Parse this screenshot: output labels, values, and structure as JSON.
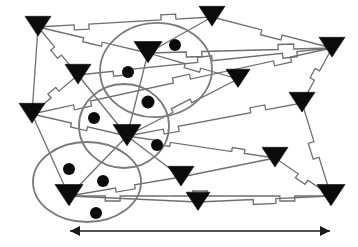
{
  "figure": {
    "title": "",
    "background_color": "#ffffff",
    "width": 358,
    "height": 247
  },
  "style": {
    "node_color": "#0b0b0b",
    "dot_color": "#0b0b0b",
    "edge_color": "#6f6f6f",
    "ellipse_color": "#7a7a7a",
    "arrow_color": "#1a1a1a",
    "edge_width": 1.3,
    "ellipse_width": 1.8,
    "arrow_width": 1.6
  },
  "legend": {
    "node_shape_name": "down-triangle",
    "dot_shape_name": "filled-circle",
    "cluster_shape_name": "ellipse",
    "edge_shape_name": "zigzag-polyline",
    "scale_bar_name": "double-headed-arrow"
  },
  "graph": {
    "node_count": 14,
    "dot_count": 9,
    "cluster_count": 3,
    "edge_count": 26,
    "nodes": [
      {
        "id": "n1",
        "x": 38,
        "y": 27,
        "size": 13
      },
      {
        "id": "n2",
        "x": 78,
        "y": 75,
        "size": 13
      },
      {
        "id": "n3",
        "x": 32,
        "y": 114,
        "size": 13
      },
      {
        "id": "n4",
        "x": 212,
        "y": 17,
        "size": 13
      },
      {
        "id": "n5",
        "x": 148,
        "y": 53,
        "size": 14
      },
      {
        "id": "n6",
        "x": 332,
        "y": 48,
        "size": 13
      },
      {
        "id": "n7",
        "x": 238,
        "y": 79,
        "size": 12
      },
      {
        "id": "n8",
        "x": 302,
        "y": 103,
        "size": 13
      },
      {
        "id": "n9",
        "x": 127,
        "y": 136,
        "size": 14
      },
      {
        "id": "n10",
        "x": 69,
        "y": 196,
        "size": 14
      },
      {
        "id": "n11",
        "x": 181,
        "y": 177,
        "size": 13
      },
      {
        "id": "n12",
        "x": 198,
        "y": 202,
        "size": 12
      },
      {
        "id": "n13",
        "x": 275,
        "y": 158,
        "size": 13
      },
      {
        "id": "n14",
        "x": 331,
        "y": 196,
        "size": 14
      }
    ],
    "dots": [
      {
        "id": "d1",
        "x": 175,
        "y": 45,
        "r": 6
      },
      {
        "id": "d2",
        "x": 128,
        "y": 72,
        "r": 6
      },
      {
        "id": "d3",
        "x": 148,
        "y": 102,
        "r": 6.5
      },
      {
        "id": "d4",
        "x": 94,
        "y": 118,
        "r": 6
      },
      {
        "id": "d5",
        "x": 157,
        "y": 145,
        "r": 6
      },
      {
        "id": "d6",
        "x": 69,
        "y": 169,
        "r": 6
      },
      {
        "id": "d7",
        "x": 103,
        "y": 181,
        "r": 6
      },
      {
        "id": "d8",
        "x": 96,
        "y": 213,
        "r": 6
      },
      {
        "id": "d9",
        "x": 320,
        "y": 140,
        "r": 0
      }
    ],
    "clusters": [
      {
        "id": "c1",
        "label": "top-cluster",
        "cx": 156,
        "cy": 70,
        "rx": 56,
        "ry": 47,
        "rotation": -4
      },
      {
        "id": "c2",
        "label": "middle-cluster",
        "cx": 124,
        "cy": 126,
        "rx": 45,
        "ry": 42,
        "rotation": 0
      },
      {
        "id": "c3",
        "label": "bottom-cluster",
        "cx": 87,
        "cy": 182,
        "rx": 54,
        "ry": 40,
        "rotation": 0
      }
    ],
    "edges": [
      {
        "from": "n1",
        "to": "n4",
        "style": "zigzag",
        "amp": 5
      },
      {
        "from": "n1",
        "to": "n2",
        "style": "zigzag",
        "amp": 5
      },
      {
        "from": "n1",
        "to": "n3",
        "style": "straight",
        "amp": 0
      },
      {
        "from": "n1",
        "to": "n5",
        "style": "zigzag",
        "amp": 4
      },
      {
        "from": "n2",
        "to": "n6",
        "style": "zigzag",
        "amp": 5
      },
      {
        "from": "n2",
        "to": "n9",
        "style": "straight",
        "amp": 0
      },
      {
        "from": "n2",
        "to": "n3",
        "style": "zigzag",
        "amp": 5
      },
      {
        "from": "n3",
        "to": "n9",
        "style": "zigzag",
        "amp": 4
      },
      {
        "from": "n3",
        "to": "n6",
        "style": "zigzag",
        "amp": 5
      },
      {
        "from": "n3",
        "to": "n10",
        "style": "straight",
        "amp": 0
      },
      {
        "from": "n4",
        "to": "n6",
        "style": "zigzag",
        "amp": 5
      },
      {
        "from": "n4",
        "to": "n5",
        "style": "straight",
        "amp": 0
      },
      {
        "from": "n5",
        "to": "n6",
        "style": "zigzag",
        "amp": 5
      },
      {
        "from": "n5",
        "to": "n7",
        "style": "zigzag",
        "amp": 4
      },
      {
        "from": "n5",
        "to": "n9",
        "style": "straight",
        "amp": 0
      },
      {
        "from": "n6",
        "to": "n8",
        "style": "zigzag",
        "amp": 5
      },
      {
        "from": "n7",
        "to": "n9",
        "style": "zigzag",
        "amp": 4
      },
      {
        "from": "n8",
        "to": "n9",
        "style": "zigzag",
        "amp": 5
      },
      {
        "from": "n8",
        "to": "n14",
        "style": "zigzag",
        "amp": 6
      },
      {
        "from": "n9",
        "to": "n10",
        "style": "straight",
        "amp": 0
      },
      {
        "from": "n9",
        "to": "n11",
        "style": "straight",
        "amp": 0
      },
      {
        "from": "n9",
        "to": "n13",
        "style": "zigzag",
        "amp": 4
      },
      {
        "from": "n10",
        "to": "n11",
        "style": "zigzag",
        "amp": 4
      },
      {
        "from": "n10",
        "to": "n14",
        "style": "zigzag",
        "amp": 5
      },
      {
        "from": "n10",
        "to": "n12",
        "style": "straight",
        "amp": 0
      },
      {
        "from": "n11",
        "to": "n13",
        "style": "straight",
        "amp": 0
      },
      {
        "from": "n12",
        "to": "n14",
        "style": "zigzag",
        "amp": 5
      },
      {
        "from": "n13",
        "to": "n14",
        "style": "zigzag",
        "amp": 5
      }
    ]
  },
  "scale_bar": {
    "label": "",
    "x1": 70,
    "x2": 330,
    "y": 231,
    "head_size": 5
  }
}
